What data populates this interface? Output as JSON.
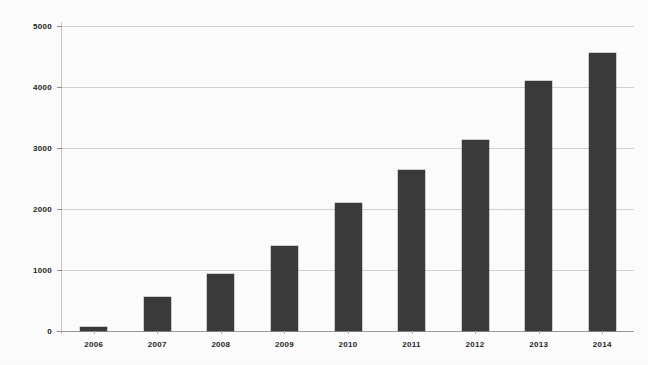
{
  "chart_data": {
    "type": "bar",
    "title": "",
    "subtitle": "",
    "xlabel": "",
    "ylabel": "",
    "categories": [
      "2006",
      "2007",
      "2008",
      "2009",
      "2010",
      "2011",
      "2012",
      "2013",
      "2014"
    ],
    "values": [
      70,
      560,
      930,
      1400,
      2100,
      2640,
      3130,
      4100,
      4560
    ],
    "series": [
      {
        "name": "",
        "values": [
          70,
          560,
          930,
          1400,
          2100,
          2640,
          3130,
          4100,
          4560
        ]
      }
    ],
    "ylim": [
      0,
      5000
    ],
    "y_ticks": [
      0,
      1000,
      2000,
      3000,
      4000,
      5000
    ],
    "y_tick_labels": [
      "0",
      "1000",
      "2000",
      "3000",
      "4000",
      "5000"
    ],
    "grid": true,
    "grid_axis": "y",
    "legend": false,
    "legend_position": "none",
    "bar_color": "#3a3a3a",
    "gridline_color": "#c9c9c9",
    "axis_color": "#c4c4c4",
    "background_color": "#fdfdfd",
    "text_color": "#232323"
  }
}
